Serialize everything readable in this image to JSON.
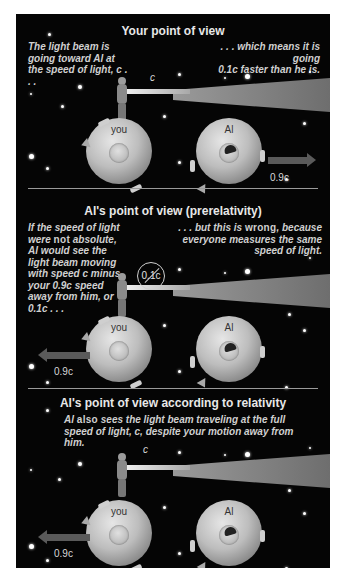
{
  "sections": [
    {
      "title": "Your point of view",
      "caption_left": "The light beam is going toward Al at the speed of light, c . . .",
      "caption_right_line1": ". . . which means it is going",
      "caption_right_line2": "0.1c faster than he is.",
      "beam_label": "c",
      "you_label": "you",
      "al_label": "Al",
      "velocity_label": "0.9c",
      "moving_object": "Al",
      "arrow_direction": "right"
    },
    {
      "title": "Al's point of view (prerelativity)",
      "caption_left_pre": "If the speed of light were",
      "caption_left_em": "not",
      "caption_left_post": "absolute, Al would see the light beam moving with speed c minus your 0.9c speed away from him, or 0.1c . . .",
      "caption_right_pre": ". . . but this is",
      "caption_right_em": "wrong",
      "caption_right_post": ", because everyone measures the same speed of light.",
      "beam_label_crossed": "0.1c",
      "you_label": "you",
      "al_label": "Al",
      "velocity_label": "0.9c",
      "moving_object": "you",
      "arrow_direction": "left"
    },
    {
      "title": "Al's point of view according to relativity",
      "caption_pre": "Al",
      "caption_em": "also",
      "caption_post": "sees the light beam traveling at the full speed of light, c, despite your motion away from him.",
      "beam_label": "c",
      "you_label": "you",
      "al_label": "Al",
      "velocity_label": "0.9c",
      "moving_object": "you",
      "arrow_direction": "left"
    }
  ],
  "colors": {
    "background": "#050505",
    "text": "#e8e8e8",
    "globe": "#bdbdbd",
    "arrow": "#5a5a5a",
    "divider": "#9a9a9a"
  }
}
